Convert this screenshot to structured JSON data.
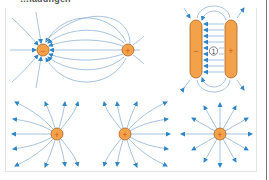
{
  "title": "…ladungen",
  "colors": {
    "field_line": "#8fb4d6",
    "arrow": "#2f86c6",
    "charge_fill": "#f4a24a",
    "charge_stroke": "#a7662a",
    "sign": "#d9531e",
    "plate_fill": "#f4a24a",
    "plate_stroke": "#a7662a",
    "panel_border": "#e2e4e7"
  },
  "diagrams": [
    {
      "id": "dipole",
      "charges": [
        {
          "sign": "−",
          "x": 43,
          "y": 50
        },
        {
          "sign": "+",
          "x": 128,
          "y": 50
        }
      ]
    },
    {
      "id": "capacitor",
      "plates": [
        {
          "sign": "−",
          "x": 190,
          "y": 20,
          "w": 12,
          "h": 58
        },
        {
          "sign": "+",
          "x": 225,
          "y": 20,
          "w": 12,
          "h": 58
        }
      ],
      "marker": "1"
    },
    {
      "id": "two-positive",
      "charges": [
        {
          "sign": "+",
          "x": 57,
          "y": 134
        },
        {
          "sign": "+",
          "x": 125,
          "y": 134
        }
      ]
    },
    {
      "id": "single-positive",
      "charges": [
        {
          "sign": "+",
          "x": 220,
          "y": 134
        }
      ]
    }
  ],
  "labels": {
    "dipole_neg": "−",
    "dipole_pos": "+",
    "plate_neg": "−",
    "plate_pos": "+",
    "capacitor_marker": "1",
    "pair_left": "+",
    "pair_right": "+",
    "single": "+"
  }
}
